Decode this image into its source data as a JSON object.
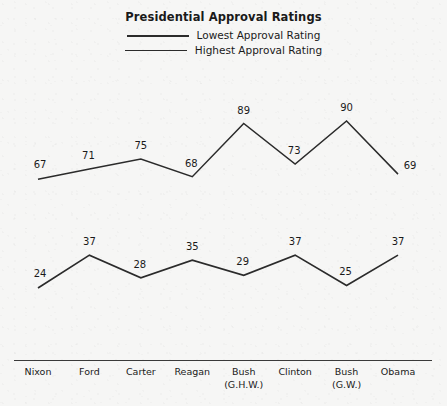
{
  "chart_data": {
    "type": "line",
    "title": "Presidential Approval Ratings",
    "xlabel": "",
    "ylabel": "",
    "grid": false,
    "legend_position": "top-center",
    "ylim": [
      0,
      100
    ],
    "categories": [
      "Nixon",
      "Ford",
      "Carter",
      "Reagan",
      "Bush\n(G.H.W.)",
      "Clinton",
      "Bush\n(G.W.)",
      "Obama"
    ],
    "category_lines": [
      [
        "Nixon"
      ],
      [
        "Ford"
      ],
      [
        "Carter"
      ],
      [
        "Reagan"
      ],
      [
        "Bush",
        "(G.H.W.)"
      ],
      [
        "Clinton"
      ],
      [
        "Bush",
        "(G.W.)"
      ],
      [
        "Obama"
      ]
    ],
    "series": [
      {
        "name": "Lowest Approval Rating",
        "values": [
          24,
          37,
          28,
          35,
          29,
          37,
          25,
          37
        ],
        "color": "#2b2b2b"
      },
      {
        "name": "Highest Approval Rating",
        "values": [
          67,
          71,
          75,
          68,
          89,
          73,
          90,
          69
        ],
        "color": "#2b2b2b"
      }
    ]
  },
  "legend": {
    "entries": [
      {
        "label": "Lowest Approval Rating"
      },
      {
        "label": "Highest Approval Rating"
      }
    ]
  },
  "colors": {
    "background": "#f6f6f5",
    "line": "#2b2b2b",
    "axis": "#3a3a3a",
    "text": "#1a1a1a"
  }
}
